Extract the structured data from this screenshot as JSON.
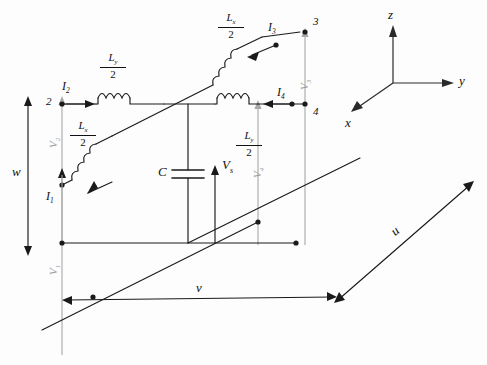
{
  "diagram": {
    "type": "circuit-schematic",
    "colors": {
      "wire": "#1a1a1a",
      "grey_wire": "#a0a0a0",
      "background": "#ffffff",
      "label": "#111111",
      "grey_label": "#9a9a9a"
    }
  },
  "axes": {
    "z_label": "z",
    "y_label": "y",
    "x_label": "x"
  },
  "nodes": [
    {
      "id": "2",
      "label": "2"
    },
    {
      "id": "3",
      "label": "3"
    },
    {
      "id": "4",
      "label": "4"
    }
  ],
  "currents": [
    {
      "name": "I1",
      "base": "I",
      "sub": "1"
    },
    {
      "name": "I2",
      "base": "I",
      "sub": "2"
    },
    {
      "name": "I3",
      "base": "I",
      "sub": "3"
    },
    {
      "name": "I4",
      "base": "I",
      "sub": "4"
    }
  ],
  "voltages": [
    {
      "name": "V1",
      "base": "V",
      "sub": "1",
      "style": "grey-rotated"
    },
    {
      "name": "V2",
      "base": "V",
      "sub": "2",
      "style": "grey-rotated"
    },
    {
      "name": "V3",
      "base": "V",
      "sub": "3",
      "style": "grey-rotated"
    },
    {
      "name": "V4",
      "base": "V",
      "sub": "4",
      "style": "grey-rotated"
    },
    {
      "name": "Vs",
      "base": "V",
      "sub": "s",
      "style": "black-upright"
    }
  ],
  "components": {
    "capacitor_label": "C",
    "inductors": [
      {
        "id": "top-right",
        "num_base": "L",
        "num_sub": "x",
        "den": "2"
      },
      {
        "id": "upper-mid",
        "num_base": "L",
        "num_sub": "y",
        "den": "2"
      },
      {
        "id": "left-lower",
        "num_base": "L",
        "num_sub": "x",
        "den": "2"
      },
      {
        "id": "right-mid",
        "num_base": "L",
        "num_sub": "y",
        "den": "2"
      }
    ]
  },
  "dimensions": [
    {
      "name": "w",
      "label": "w",
      "orientation": "vertical-left"
    },
    {
      "name": "v",
      "label": "v",
      "orientation": "horizontal-bottom"
    },
    {
      "name": "u",
      "label": "u",
      "orientation": "diagonal-right"
    }
  ]
}
